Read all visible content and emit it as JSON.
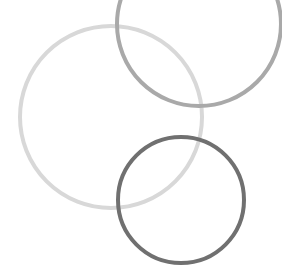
{
  "canvas": {
    "width": 282,
    "height": 273,
    "background": "#ffffff"
  },
  "circles": [
    {
      "name": "light-circle",
      "cx": 111,
      "cy": 117,
      "r": 91,
      "stroke": "#d8d8d8",
      "stroke_width": 4
    },
    {
      "name": "medium-circle",
      "cx": 199,
      "cy": 24,
      "r": 82,
      "stroke": "#a9a9a9",
      "stroke_width": 4
    },
    {
      "name": "dark-circle",
      "cx": 181,
      "cy": 200,
      "r": 63,
      "stroke": "#707070",
      "stroke_width": 4
    }
  ]
}
